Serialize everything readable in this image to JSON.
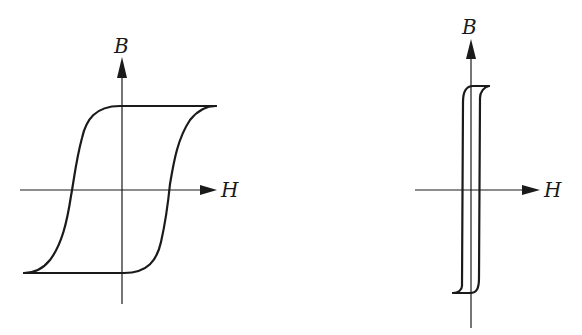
{
  "figure": {
    "colors": {
      "ink": "#1a1a1a",
      "background": "#ffffff"
    },
    "panels": [
      {
        "id": "left",
        "title": "Wide hysteresis loop (hard magnetic material)",
        "axes": {
          "x_label": "H",
          "y_label": "B"
        }
      },
      {
        "id": "right",
        "title": "Narrow hysteresis loop (soft magnetic material)",
        "axes": {
          "x_label": "H",
          "y_label": "B"
        }
      }
    ]
  }
}
